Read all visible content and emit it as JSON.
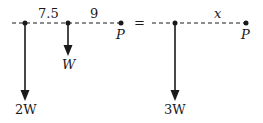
{
  "diagram": {
    "left_system": {
      "distance_1": "7.5",
      "distance_2": "9",
      "point_label": "P",
      "force_large_label": "2W",
      "force_small_label": "W"
    },
    "equals": "=",
    "right_system": {
      "distance_label": "x",
      "point_label": "P",
      "force_label": "3W"
    },
    "colors": {
      "line": "#1a1a1a",
      "background": "#ffffff"
    }
  }
}
